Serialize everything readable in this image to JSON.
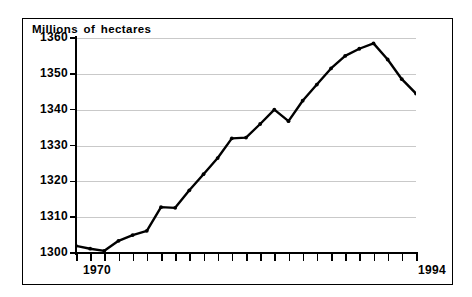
{
  "chart_data": {
    "type": "line",
    "title": "Millions of hectares",
    "xlabel": "",
    "ylabel": "",
    "ylim": [
      1300,
      1360
    ],
    "xlim": [
      1970,
      1994
    ],
    "grid": true,
    "legend": null,
    "yticks": [
      1360,
      1350,
      1340,
      1330,
      1320,
      1310,
      1300
    ],
    "ytick_labels": [
      "1360",
      "1350",
      "1340",
      "1330",
      "1320",
      "1310",
      "1300"
    ],
    "xtick_labels_shown": [
      "1970",
      "1994"
    ],
    "x": [
      1970,
      1971,
      1972,
      1973,
      1974,
      1975,
      1976,
      1977,
      1978,
      1979,
      1980,
      1981,
      1982,
      1983,
      1984,
      1985,
      1986,
      1987,
      1988,
      1989,
      1990,
      1991,
      1992,
      1993,
      1994
    ],
    "values": [
      1302.0,
      1301.2,
      1300.6,
      1303.4,
      1305.0,
      1306.2,
      1312.8,
      1312.6,
      1317.5,
      1322.0,
      1326.5,
      1332.0,
      1332.2,
      1336.0,
      1340.0,
      1336.8,
      1342.5,
      1347.0,
      1351.5,
      1355.0,
      1357.0,
      1358.5,
      1354.0,
      1348.5,
      1344.5
    ],
    "markers": true,
    "line_color": "#000000",
    "grid_color": "#c9c9c9",
    "background": "#ffffff"
  },
  "axis": {
    "title": "Millions of hectares",
    "x_start_label": "1970",
    "x_end_label": "1994"
  }
}
